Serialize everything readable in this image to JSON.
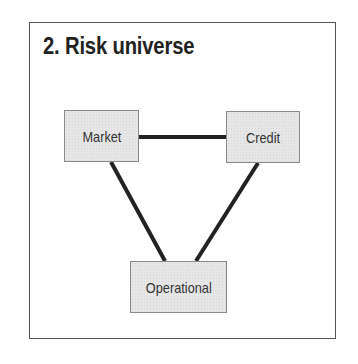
{
  "title": "2. Risk universe",
  "diagram": {
    "nodes": [
      {
        "id": "market",
        "label": "Market"
      },
      {
        "id": "credit",
        "label": "Credit"
      },
      {
        "id": "operational",
        "label": "Operational"
      }
    ],
    "edges": [
      {
        "from": "market",
        "to": "credit"
      },
      {
        "from": "market",
        "to": "operational"
      },
      {
        "from": "credit",
        "to": "operational"
      }
    ]
  },
  "colors": {
    "node_fill": "#e6e6e6",
    "node_border": "#8a8a8a",
    "edge": "#222222",
    "text": "#333333",
    "frame_border": "#555555"
  }
}
